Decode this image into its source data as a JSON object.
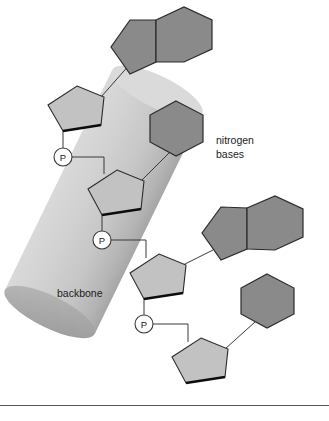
{
  "figure": {
    "background_color": "#ffffff",
    "width": 329,
    "height": 421
  },
  "labels": {
    "nitrogen_bases_line1": "nitrogen",
    "nitrogen_bases_line2": "bases",
    "backbone": "backbone"
  },
  "phosphates": [
    {
      "symbol": "P",
      "name": "phosphate-1",
      "cx": 63,
      "cy": 157,
      "r": 9
    },
    {
      "symbol": "P",
      "name": "phosphate-2",
      "cx": 102,
      "cy": 240,
      "r": 9
    },
    {
      "symbol": "P",
      "name": "phosphate-3",
      "cx": 144,
      "cy": 324,
      "r": 9
    }
  ],
  "colors": {
    "base_fill": "#8a8a8a",
    "base_stroke": "#2b2b2b",
    "sugar_fill": "#c2c2c2",
    "sugar_stroke": "#2b2b2b",
    "sugar_bottom_edge": "#111111",
    "backbone_band_light": "#d8d8d8",
    "backbone_band_mid": "#cccccc",
    "backbone_band_dark": "#a8a8a8",
    "backbone_cap_dark": "#9a9a9a",
    "phosphate_fill": "#ffffff",
    "phosphate_stroke": "#3a3a3a",
    "bond_line": "#3a3a3a",
    "rule_line": "#555555",
    "text": "#1a1a1a"
  },
  "structure": {
    "nucleotide_count": 4,
    "base_types": [
      "purine",
      "pyrimidine",
      "purine",
      "pyrimidine"
    ],
    "bases": [
      {
        "name": "nitrogen-base-purine-1",
        "type": "purine",
        "pentagon_center": [
          131,
          41
        ],
        "hexagon_center": [
          180,
          41
        ]
      },
      {
        "name": "nitrogen-base-pyrimidine-1",
        "type": "pyrimidine",
        "hexagon_center": [
          176,
          128
        ]
      },
      {
        "name": "nitrogen-base-purine-2",
        "type": "purine",
        "pentagon_center": [
          222,
          228
        ],
        "hexagon_center": [
          272,
          228
        ]
      },
      {
        "name": "nitrogen-base-pyrimidine-2",
        "type": "pyrimidine",
        "hexagon_center": [
          267,
          300
        ]
      }
    ],
    "sugars": [
      {
        "name": "sugar-ring-1",
        "center": [
          77,
          113
        ]
      },
      {
        "name": "sugar-ring-2",
        "center": [
          117,
          197
        ]
      },
      {
        "name": "sugar-ring-3",
        "center": [
          159,
          281
        ]
      },
      {
        "name": "sugar-ring-4",
        "center": [
          201,
          365
        ]
      }
    ]
  },
  "footer_rule": {
    "name": "bottom-horizontal-rule",
    "y": 405
  }
}
